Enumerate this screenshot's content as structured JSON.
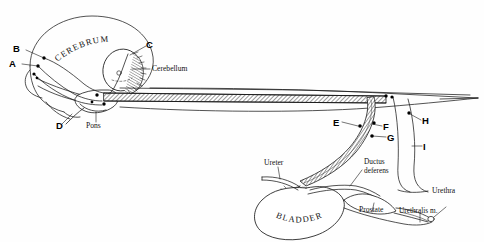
{
  "figure": {
    "background_color": "#fefefe",
    "ink_color": "#111111",
    "width": 484,
    "height": 242
  },
  "curved_labels": {
    "cerebrum": "CEREBRUM",
    "bladder": "BLADDER"
  },
  "point_labels": {
    "a": "A",
    "b": "B",
    "c": "C",
    "d": "D",
    "e": "E",
    "f": "F",
    "g": "G",
    "h": "H",
    "i": "I"
  },
  "anatomy_labels": {
    "cerebellum": "Cerebellum",
    "pons": "Pons",
    "ureter": "Ureter",
    "ductus_deferens_line1": "Ductus",
    "ductus_deferens_line2": "deferens",
    "prostate": "Prostate",
    "urethra": "Urethra",
    "urethralis": "Urethralis m."
  }
}
